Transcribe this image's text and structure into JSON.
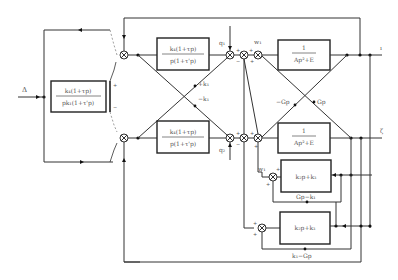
{
  "diagram": {
    "type": "control-block-diagram",
    "input_label": "Δ",
    "blocks": {
      "left_controller": {
        "numerator": "k₄(1+τp)",
        "denominator": "pk₁(1+τ'p)"
      },
      "top_controller": {
        "numerator": "k₄(1+τp)",
        "denominator": "p(1+τ'p)"
      },
      "bottom_controller": {
        "numerator": "k₄(1+τp)",
        "denominator": "p(1+τ'p)"
      },
      "top_plant": {
        "numerator": "1",
        "denominator": "Ap²+E"
      },
      "bottom_plant": {
        "numerator": "1",
        "denominator": "Ap²+E"
      },
      "feedback_upper": {
        "label": "k₂p+k₃"
      },
      "feedback_lower": {
        "label": "k₂p+k₃"
      }
    },
    "signals": {
      "q1": "q₁",
      "q2": "q₂",
      "w1_top": "w₁",
      "w1_mid": "w₁",
      "plus_k1": "+k₁",
      "minus_k1": "−k₁",
      "minus_gp": "−Gp",
      "gp": "Gp",
      "gp_minus_k1": "Gp−k₁",
      "k1_minus_gp": "k₁−Gp",
      "out1": "ı",
      "out2": "ζ"
    },
    "signs": {
      "plus": "+",
      "minus": "−"
    }
  }
}
